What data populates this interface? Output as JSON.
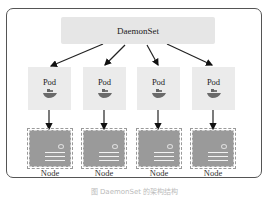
{
  "diagram": {
    "controller": {
      "label": "DaemonSet"
    },
    "pods": [
      {
        "label": "Pod",
        "icon": "docker-whale-icon"
      },
      {
        "label": "Pod",
        "icon": "docker-whale-icon"
      },
      {
        "label": "Pod",
        "icon": "docker-whale-icon"
      },
      {
        "label": "Pod",
        "icon": "docker-whale-icon"
      }
    ],
    "nodes": [
      {
        "label": "Node"
      },
      {
        "label": "Node"
      },
      {
        "label": "Node"
      },
      {
        "label": "Node"
      }
    ],
    "edges": [
      {
        "from": "DaemonSet",
        "to": "Pod 1"
      },
      {
        "from": "DaemonSet",
        "to": "Pod 2"
      },
      {
        "from": "DaemonSet",
        "to": "Pod 3"
      },
      {
        "from": "DaemonSet",
        "to": "Pod 4"
      },
      {
        "from": "Pod 1",
        "to": "Node 1"
      },
      {
        "from": "Pod 2",
        "to": "Node 2"
      },
      {
        "from": "Pod 3",
        "to": "Node 3"
      },
      {
        "from": "Pod 4",
        "to": "Node 4"
      }
    ],
    "caption": "图 DaemonSet 的架构结构"
  }
}
